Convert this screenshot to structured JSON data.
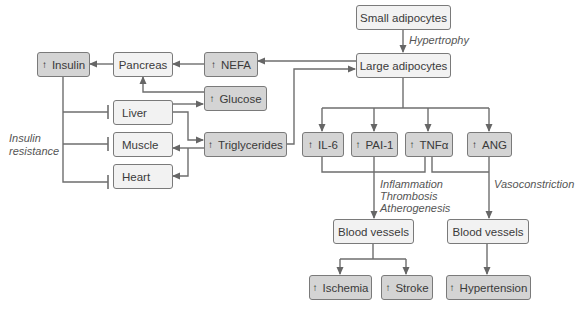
{
  "diagram": {
    "nodes": {
      "small_adipocytes": {
        "label": "Small adipocytes"
      },
      "large_adipocytes": {
        "label": "Large adipocytes"
      },
      "insulin": {
        "label": "Insulin",
        "increased": true,
        "arrow": "↑"
      },
      "pancreas": {
        "label": "Pancreas"
      },
      "nefa": {
        "label": "NEFA",
        "increased": true,
        "arrow": "↑"
      },
      "glucose": {
        "label": "Glucose",
        "increased": true,
        "arrow": "↑"
      },
      "liver": {
        "label": "Liver"
      },
      "muscle": {
        "label": "Muscle"
      },
      "heart": {
        "label": "Heart"
      },
      "triglycerides": {
        "label": "Triglycerides",
        "increased": true,
        "arrow": "↑"
      },
      "il6": {
        "label": "IL-6",
        "increased": true,
        "arrow": "↑"
      },
      "pai1": {
        "label": "PAI-1",
        "increased": true,
        "arrow": "↑"
      },
      "tnfa": {
        "label": "TNFα",
        "increased": true,
        "arrow": "↑"
      },
      "ang": {
        "label": "ANG",
        "increased": true,
        "arrow": "↑"
      },
      "blood_vessels_left": {
        "label": "Blood vessels"
      },
      "blood_vessels_right": {
        "label": "Blood vessels"
      },
      "ischemia": {
        "label": "Ischemia",
        "increased": true,
        "arrow": "↑"
      },
      "stroke": {
        "label": "Stroke",
        "increased": true,
        "arrow": "↑"
      },
      "hypertension": {
        "label": "Hypertension",
        "increased": true,
        "arrow": "↑"
      }
    },
    "annotations": {
      "hypertrophy": "Hypertrophy",
      "insulin_resistance_line1": "Insulin",
      "insulin_resistance_line2": "resistance",
      "inflammation": "Inflammation",
      "thrombosis": "Thrombosis",
      "atherogenesis": "Atherogenesis",
      "vasoconstriction": "Vasoconstriction"
    },
    "edges": [
      {
        "from": "small_adipocytes",
        "to": "large_adipocytes",
        "type": "arrow",
        "label": "Hypertrophy"
      },
      {
        "from": "large_adipocytes",
        "to": "nefa",
        "type": "arrow"
      },
      {
        "from": "triglycerides",
        "to": "large_adipocytes",
        "type": "arrow"
      },
      {
        "from": "nefa",
        "to": "pancreas",
        "type": "arrow"
      },
      {
        "from": "pancreas",
        "to": "insulin",
        "type": "arrow"
      },
      {
        "from": "glucose",
        "to": "pancreas",
        "type": "arrow"
      },
      {
        "from": "liver",
        "to": "glucose",
        "type": "arrow"
      },
      {
        "from": "liver",
        "to": "triglycerides",
        "type": "arrow"
      },
      {
        "from": "triglycerides",
        "to": "muscle",
        "type": "arrow"
      },
      {
        "from": "triglycerides",
        "to": "heart",
        "type": "arrow"
      },
      {
        "from": "insulin",
        "to": "liver",
        "type": "inhibit",
        "label": "Insulin resistance"
      },
      {
        "from": "insulin",
        "to": "muscle",
        "type": "inhibit"
      },
      {
        "from": "insulin",
        "to": "heart",
        "type": "inhibit"
      },
      {
        "from": "large_adipocytes",
        "to": "il6",
        "type": "arrow"
      },
      {
        "from": "large_adipocytes",
        "to": "pai1",
        "type": "arrow"
      },
      {
        "from": "large_adipocytes",
        "to": "tnfa",
        "type": "arrow"
      },
      {
        "from": "large_adipocytes",
        "to": "ang",
        "type": "arrow"
      },
      {
        "from": [
          "il6",
          "pai1",
          "tnfa"
        ],
        "to": "blood_vessels_left",
        "type": "arrow",
        "label": "Inflammation Thrombosis Atherogenesis"
      },
      {
        "from": [
          "tnfa",
          "ang"
        ],
        "to": "blood_vessels_right",
        "type": "arrow",
        "label": "Vasoconstriction"
      },
      {
        "from": "blood_vessels_left",
        "to": "ischemia",
        "type": "arrow"
      },
      {
        "from": "blood_vessels_left",
        "to": "stroke",
        "type": "arrow"
      },
      {
        "from": "blood_vessels_right",
        "to": "hypertension",
        "type": "arrow"
      }
    ]
  }
}
